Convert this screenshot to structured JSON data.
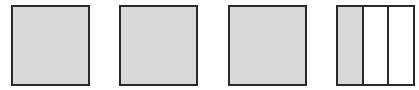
{
  "figure": {
    "shaded_color": "#d9d9d9",
    "border_color": "#2a2a2a",
    "squares": [
      {
        "parts": 1,
        "shaded": 1
      },
      {
        "parts": 1,
        "shaded": 1
      },
      {
        "parts": 1,
        "shaded": 1
      },
      {
        "parts": 3,
        "shaded": 1
      }
    ]
  }
}
